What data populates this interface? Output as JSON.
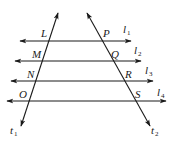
{
  "diagram": {
    "type": "geometry",
    "stroke_color": "#1a1a1a",
    "background": "#ffffff",
    "parallel_lines": [
      {
        "id": "l1",
        "label": "l",
        "sub": "1",
        "y": 41,
        "x1": 20,
        "x2": 131,
        "label_x": 123,
        "label_y": 33
      },
      {
        "id": "l2",
        "label": "l",
        "sub": "2",
        "y": 61,
        "x1": 15,
        "x2": 141,
        "label_x": 134,
        "label_y": 54
      },
      {
        "id": "l3",
        "label": "l",
        "sub": "3",
        "y": 81,
        "x1": 11,
        "x2": 153,
        "label_x": 145,
        "label_y": 74
      },
      {
        "id": "l4",
        "label": "l",
        "sub": "4",
        "y": 101,
        "x1": 7,
        "x2": 166,
        "label_x": 157,
        "label_y": 96
      }
    ],
    "transversals": [
      {
        "id": "t1",
        "label": "t",
        "sub": "1",
        "x1": 58,
        "y1": 13,
        "x2": 21,
        "y2": 126,
        "label_x": 10,
        "label_y": 134
      },
      {
        "id": "t2",
        "label": "t",
        "sub": "2",
        "x1": 87,
        "y1": 13,
        "x2": 150,
        "y2": 126,
        "label_x": 151,
        "label_y": 134
      }
    ],
    "points": [
      {
        "name": "L",
        "x": 41,
        "y": 37
      },
      {
        "name": "M",
        "x": 32,
        "y": 58
      },
      {
        "name": "N",
        "x": 27,
        "y": 78
      },
      {
        "name": "O",
        "x": 19,
        "y": 98
      },
      {
        "name": "P",
        "x": 103,
        "y": 37
      },
      {
        "name": "Q",
        "x": 111,
        "y": 58
      },
      {
        "name": "R",
        "x": 125,
        "y": 78
      },
      {
        "name": "S",
        "x": 135,
        "y": 98
      }
    ]
  }
}
